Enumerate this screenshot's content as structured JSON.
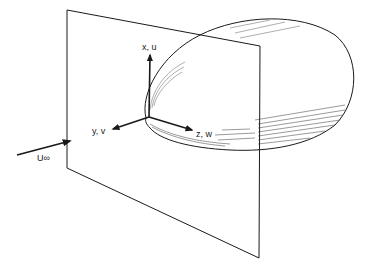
{
  "diagram": {
    "type": "3d-coordinate-sketch",
    "labels": {
      "x_axis": "x, u",
      "y_axis": "y, v",
      "z_axis": "z, w",
      "freestream": "U∞"
    },
    "colors": {
      "line": "#1a1a1a",
      "hatch": "#555555",
      "background": "#ffffff"
    }
  }
}
